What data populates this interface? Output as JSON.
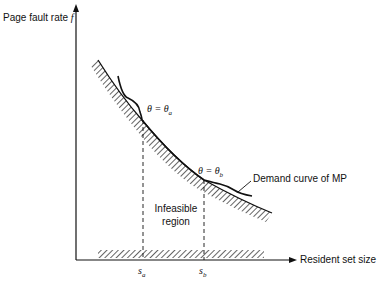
{
  "figure": {
    "y_axis_label": "Page fault rate",
    "y_axis_symbol": "f",
    "x_axis_label": "Resident set size",
    "theta_a_label": "θ = θa",
    "theta_a_lhs": "θ = θ",
    "theta_a_sub": "a",
    "theta_b_lhs": "θ = θ",
    "theta_b_sub": "b",
    "demand_curve_label": "Demand curve of MP",
    "region_label_line1": "Infeasible",
    "region_label_line2": "region",
    "s_a_base": "s",
    "s_a_sub": "a",
    "s_b_base": "s",
    "s_b_sub": "b"
  }
}
